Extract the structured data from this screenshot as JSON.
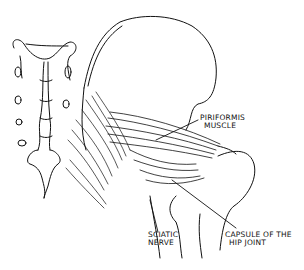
{
  "figure": {
    "type": "anatomical line drawing"
  },
  "labels": {
    "piriformis": {
      "line1": "PIRIFORMIS",
      "line2": "MUSCLE"
    },
    "sciatic": {
      "line1": "SCIATIC",
      "line2": "NERVE"
    },
    "capsule": {
      "line1": "CAPSULE OF THE",
      "line2": "HIP JOINT"
    }
  },
  "colors": {
    "ink": "#111111",
    "background": "#ffffff"
  }
}
